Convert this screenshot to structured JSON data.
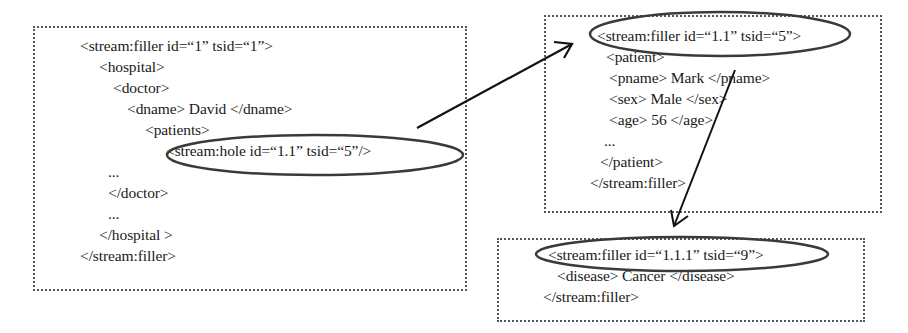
{
  "diagram": {
    "boxes": [
      {
        "id": "root-filler",
        "lines": [
          "<stream:filler id=“1” tsid=“1”>",
          "<hospital>",
          "<doctor>",
          "<dname> David </dname>",
          "<patients>",
          "<stream:hole id=“1.1” tsid=“5”/>",
          "...",
          "</doctor>",
          "...",
          "</hospital >",
          "</stream:filler>"
        ]
      },
      {
        "id": "patient-filler",
        "lines": [
          "<stream:filler id=“1.1” tsid=“5”>",
          "<patient>",
          "<pname> Mark </pname>",
          "<sex> Male </sex>",
          "<age> 56 </age>",
          "...",
          "</patient>",
          "</stream:filler>"
        ]
      },
      {
        "id": "disease-filler",
        "lines": [
          "<stream:filler id=“1.1.1” tsid=“9”>",
          "<disease> Cancer </disease>",
          "</stream:filler>"
        ]
      }
    ],
    "arrows": [
      {
        "from": "stream:hole id=“1.1”",
        "to": "stream:filler id=“1.1”"
      },
      {
        "from": "pname Mark",
        "to": "stream:filler id=“1.1.1”"
      }
    ],
    "colors": {
      "border": "#555555",
      "text": "#1a1a1a",
      "ellipse": "#3a3a3a",
      "arrow": "#111111"
    }
  }
}
